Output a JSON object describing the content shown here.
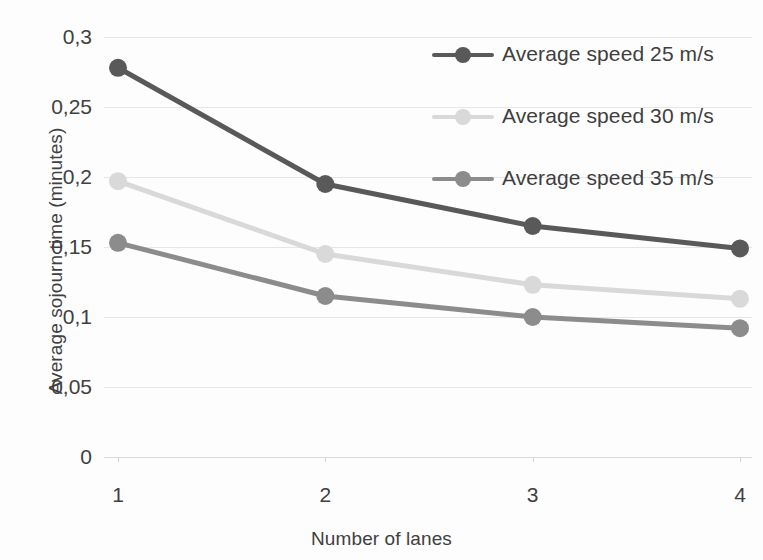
{
  "chart_data": {
    "type": "line",
    "title": "",
    "xlabel": "Number of lanes",
    "ylabel": "Average sojourn time (minutes)",
    "categories": [
      "1",
      "2",
      "3",
      "4"
    ],
    "x": [
      1,
      2,
      3,
      4
    ],
    "xlim": [
      1,
      4
    ],
    "ylim": [
      0,
      0.3
    ],
    "ytick_labels": [
      "0,3",
      "0,25",
      "0,2",
      "0,15",
      "0,1",
      "0,05",
      "0"
    ],
    "ytick_values": [
      0.3,
      0.25,
      0.2,
      0.15,
      0.1,
      0.05,
      0
    ],
    "xtick_labels": [
      "1",
      "2",
      "3",
      "4"
    ],
    "decimal_separator": ",",
    "grid": true,
    "legend_position": "top-right",
    "series": [
      {
        "name": "Average speed 25 m/s",
        "color": "#595959",
        "marker": "circle",
        "values": [
          0.278,
          0.195,
          0.165,
          0.149
        ]
      },
      {
        "name": "Average speed 30 m/s",
        "color": "#d9d9d9",
        "marker": "circle",
        "values": [
          0.197,
          0.145,
          0.123,
          0.113
        ]
      },
      {
        "name": "Average speed 35 m/s",
        "color": "#8c8c8c",
        "marker": "circle",
        "values": [
          0.153,
          0.115,
          0.1,
          0.092
        ]
      }
    ]
  },
  "colors": {
    "background": "#fdfdfd",
    "gridline": "#e6e6e6",
    "axis_text": "#404040",
    "series_25": "#595959",
    "series_30": "#d9d9d9",
    "series_35": "#8c8c8c"
  }
}
